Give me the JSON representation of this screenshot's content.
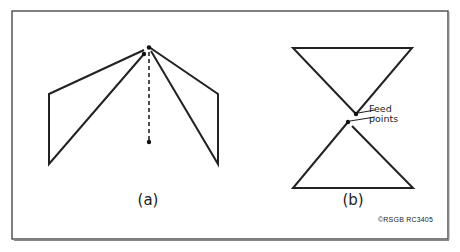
{
  "figure": {
    "frame": {
      "x": 12,
      "y": 11,
      "width": 436,
      "height": 228,
      "stroke": "#444444"
    },
    "line_color": "#222222",
    "panel_a": {
      "label": "(a)",
      "label_pos": [
        148,
        192
      ],
      "apex_dot": [
        149,
        47
      ],
      "apex_dot2": [
        144,
        54
      ],
      "left_wing": [
        [
          144,
          50
        ],
        [
          49,
          94
        ],
        [
          49,
          164
        ],
        [
          144,
          54
        ]
      ],
      "right_wing": [
        [
          149,
          47
        ],
        [
          218,
          94
        ],
        [
          218,
          164
        ],
        [
          149,
          50
        ]
      ],
      "dashed_mast": {
        "x": 149,
        "y1": 50,
        "y2": 142
      },
      "mast_bottom_dot": [
        149,
        142
      ]
    },
    "panel_b": {
      "label": "(b)",
      "label_pos": [
        352,
        192
      ],
      "top_triangle": [
        [
          293,
          48
        ],
        [
          412,
          48
        ],
        [
          356,
          114
        ]
      ],
      "bottom_triangle": [
        [
          348,
          122
        ],
        [
          293,
          188
        ],
        [
          413,
          188
        ]
      ],
      "feed_dots": [
        [
          356,
          114
        ],
        [
          348,
          122
        ]
      ],
      "annotation": {
        "line1": "Feed",
        "line2": "points"
      }
    },
    "copyright": "©RSGB RC3405"
  }
}
